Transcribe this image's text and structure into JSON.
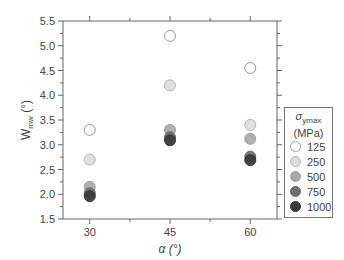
{
  "chart_data": {
    "type": "scatter",
    "title": "",
    "xlabel": "α (°)",
    "ylabel": "W_mw (°)",
    "ylabel_main": "W",
    "ylabel_sub": "mw",
    "ylabel_unit": " (°)",
    "xlim": [
      25,
      65
    ],
    "ylim": [
      1.5,
      5.5
    ],
    "x_ticks": [
      30,
      45,
      60
    ],
    "y_ticks": [
      1.5,
      2.0,
      2.5,
      3.0,
      3.5,
      4.0,
      4.5,
      5.0,
      5.5
    ],
    "y_tick_labels": [
      "1.5",
      "2.0",
      "2.5",
      "3.0",
      "3.5",
      "4.0",
      "4.5",
      "5.0",
      "5.5"
    ],
    "grid": false,
    "legend_position": "right",
    "legend_title": "σymax (MPa)",
    "legend_title_symbol": "σ",
    "legend_title_sub": "ymax",
    "legend_title_unit": "(MPa)",
    "x": [
      30,
      45,
      60
    ],
    "series": [
      {
        "name": "125",
        "values": [
          3.3,
          5.2,
          4.55
        ],
        "fill": "#ffffff",
        "stroke": "#9a9a9a"
      },
      {
        "name": "250",
        "values": [
          2.7,
          4.2,
          3.4
        ],
        "fill": "#dcdcdc",
        "stroke": "#b4b4b4"
      },
      {
        "name": "500",
        "values": [
          2.15,
          3.3,
          3.12
        ],
        "fill": "#a8a8a8",
        "stroke": "#a0a0a0"
      },
      {
        "name": "750",
        "values": [
          2.02,
          3.15,
          2.76
        ],
        "fill": "#6e6e6e",
        "stroke": "#666666"
      },
      {
        "name": "1000",
        "values": [
          1.96,
          3.09,
          2.69
        ],
        "fill": "#3a3a3a",
        "stroke": "#333333"
      }
    ]
  }
}
